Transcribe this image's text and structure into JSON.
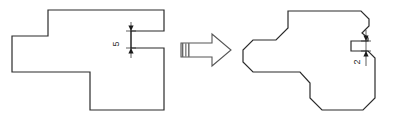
{
  "figure": {
    "title": "",
    "type": "technical-drawing",
    "background_color": "#ffffff",
    "line_color": "#2b2b2b",
    "line_width": 1.2
  },
  "left_figure": {
    "name": "original-profile",
    "label": "",
    "outline_points": "48,10 164,10 164,31 131,31 131,48 164,48 164,110 90,110 90,72 12,72 12,36 48,36",
    "dimension": {
      "name": "notch-depth-dimension",
      "value": "5",
      "rotation_degrees": -90,
      "text_x": 119,
      "text_y": 44,
      "ext_line_x": 131,
      "ext_top_y": 22,
      "ext_bottom_y": 58,
      "arrow_top_y": 31,
      "arrow_bottom_y": 48
    }
  },
  "transform_arrow": {
    "name": "transform-arrow",
    "label": "",
    "tail_hatch_stripes": 3,
    "outline_points": "181,43 212,43 212,34 231,50 212,66 212,57 181,57",
    "hatch_x_positions": [
      182.5,
      185.5,
      188.5
    ],
    "hatch_top_y": 43,
    "hatch_bottom_y": 57
  },
  "right_figure": {
    "name": "chamfered-profile",
    "label": "",
    "outline_points": "288,11 361,11 369,19 369,26 362,33 368,38 368,41 351,41 351,51 368,51 375,58 375,98 363,110 322,110 310,98 310,83 300,72 253,72 243,62 243,50 253,40 276,40 288,28",
    "dimension": {
      "name": "chamfer-notch-dimension",
      "value": "2",
      "rotation_degrees": -90,
      "text_x": 360,
      "text_y": 62,
      "ext_line_x": 366,
      "ext_top_y": 30,
      "ext_bottom_y": 66,
      "arrow_top_y": 41,
      "arrow_bottom_y": 51
    }
  },
  "colors": {
    "line": "#2b2b2b",
    "dimension": "#1a1a1a",
    "hatch": "#555555",
    "background": "#ffffff"
  }
}
